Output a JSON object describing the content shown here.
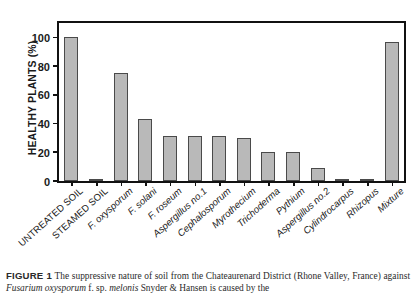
{
  "figure": {
    "caption_label": "FIGURE 1",
    "caption_text_1": "The suppressive nature of soil from the Chateaurenard District (Rhone Valley,",
    "caption_text_2_pre": "France) against ",
    "caption_species_1": "Fusarium oxysporum",
    "caption_text_2_mid": " f. sp. ",
    "caption_species_2": "melonis",
    "caption_text_2_post": " Snyder & Hansen is caused by the"
  },
  "chart_data": {
    "type": "bar",
    "title": "",
    "xlabel": "",
    "ylabel": "HEALTHY PLANTS (%)",
    "ylim": [
      0,
      110
    ],
    "yticks": [
      0,
      20,
      40,
      60,
      80,
      100
    ],
    "ytick_labels": [
      "0",
      "20",
      "40",
      "60",
      "80",
      "100"
    ],
    "grid": false,
    "legend": false,
    "bar_color": "#b9b9b9",
    "bar_edge_color": "#4a4a4a",
    "axis_color": "#111111",
    "categories": [
      "UNTREATED SOIL",
      "STEAMED SOIL",
      "F. oxysporum",
      "F. solani",
      "F. roseum",
      "Aspergillus no.1",
      "Cephalosporum",
      "Myrothecium",
      "Trichoderma",
      "Pythium",
      "Aspergillus no.2",
      "Cylindrocarpus",
      "Rhizopus",
      "Mixture"
    ],
    "category_styles": [
      "caps",
      "caps",
      "italic",
      "italic",
      "italic",
      "italic",
      "italic",
      "italic",
      "italic",
      "italic",
      "italic",
      "italic",
      "italic",
      "italic"
    ],
    "values": [
      100,
      0.5,
      75,
      43,
      31,
      31,
      31,
      30,
      20,
      20,
      9,
      0.8,
      0.8,
      97
    ]
  }
}
